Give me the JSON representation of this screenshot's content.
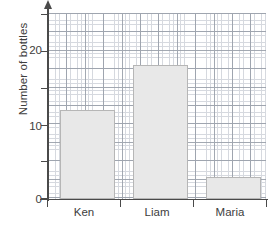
{
  "chart_data": {
    "type": "bar",
    "title": "",
    "xlabel": "",
    "ylabel": "Number of bottles",
    "categories": [
      "Ken",
      "Liam",
      "Maria"
    ],
    "values": [
      12,
      18,
      3
    ],
    "ylim": [
      0,
      25
    ],
    "y_ticks": [
      0,
      5,
      10,
      15,
      20,
      25
    ],
    "y_tick_labels": [
      "0",
      "",
      "10",
      "",
      "20",
      ""
    ],
    "grid": true,
    "grid_style": "graph-paper",
    "legend": "none",
    "bar_color": "#e8e8e8",
    "bar_border_color": "#b6b6b6",
    "axis_color": "#4a4a4a",
    "grid_minor_color": "#cfd3da",
    "grid_major_color": "#9aa0aa",
    "y_axis_arrow": true
  },
  "axis": {
    "y_title": "Number of bottles",
    "y_labels": [
      {
        "text": "20",
        "value": 20
      },
      {
        "text": "10",
        "value": 10
      },
      {
        "text": "0",
        "value": 0
      }
    ],
    "x_labels": [
      {
        "text": "Ken",
        "value": 12
      },
      {
        "text": "Liam",
        "value": 18
      },
      {
        "text": "Maria",
        "value": 3
      }
    ]
  }
}
